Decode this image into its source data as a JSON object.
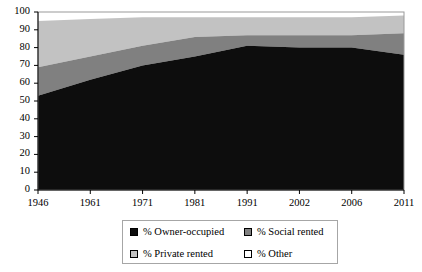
{
  "chart_data": {
    "type": "area",
    "title": "",
    "subtitle": "",
    "xlabel": "",
    "ylabel": "",
    "stacked": true,
    "grid": false,
    "legend_position": "bottom",
    "ylim": [
      0,
      100
    ],
    "yticks": [
      0,
      10,
      20,
      30,
      40,
      50,
      60,
      70,
      80,
      90,
      100
    ],
    "ytick_labels": [
      "0",
      "10",
      "20",
      "30",
      "40",
      "50",
      "60",
      "70",
      "80",
      "90",
      "100"
    ],
    "categories": [
      "1946",
      "1961",
      "1971",
      "1981",
      "1991",
      "2002",
      "2006",
      "2011"
    ],
    "x_positions": [
      1946,
      1961,
      1971,
      1981,
      1991,
      2002,
      2006,
      2011
    ],
    "series": [
      {
        "name": "% Owner-occupied",
        "color": "#0d0d0d",
        "values": [
          53,
          62,
          70,
          75,
          81,
          80,
          80,
          76
        ]
      },
      {
        "name": "% Social rented",
        "color": "#808080",
        "values": [
          16,
          13,
          11,
          11,
          6,
          7,
          7,
          12
        ]
      },
      {
        "name": "% Private rented",
        "color": "#c2c2c2",
        "values": [
          26,
          21,
          16,
          11,
          10,
          10,
          10,
          10
        ]
      },
      {
        "name": "% Other",
        "color": "#ffffff",
        "values": [
          5,
          4,
          3,
          3,
          3,
          3,
          3,
          2
        ]
      }
    ],
    "cumulative_tops": {
      "owner_occupied": [
        53,
        62,
        70,
        75,
        81,
        80,
        80,
        76
      ],
      "plus_social": [
        69,
        75,
        81,
        86,
        87,
        87,
        87,
        88
      ],
      "plus_private": [
        95,
        96,
        97,
        97,
        97,
        97,
        97,
        98
      ],
      "plus_other": [
        100,
        100,
        100,
        100,
        100,
        100,
        100,
        100
      ]
    }
  },
  "axes": {
    "y_tick_labels": [
      "100",
      "90",
      "80",
      "70",
      "60",
      "50",
      "40",
      "30",
      "20",
      "10",
      "0"
    ],
    "x_tick_labels": [
      "1946",
      "1961",
      "1971",
      "1981",
      "1991",
      "2002",
      "2006",
      "2011"
    ]
  },
  "legend": {
    "entries": [
      {
        "label": "% Owner-occupied",
        "color": "#0d0d0d"
      },
      {
        "label": "% Social rented",
        "color": "#808080"
      },
      {
        "label": "% Private rented",
        "color": "#c2c2c2"
      },
      {
        "label": "% Other",
        "color": "#ffffff"
      }
    ]
  }
}
